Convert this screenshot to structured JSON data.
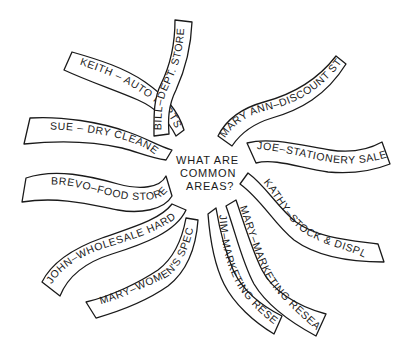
{
  "diagram": {
    "type": "brainstorm-spoke",
    "center": {
      "lines": [
        "WHAT ARE",
        "COMMON",
        "AREAS?"
      ]
    },
    "colors": {
      "ink": "#1a1a1a",
      "background": "#ffffff"
    },
    "ribbons": [
      {
        "id": "keith",
        "label": "KEITH – AUTO PARTS"
      },
      {
        "id": "bill",
        "label": "BILL–DEPT. STORE MGT."
      },
      {
        "id": "maryann",
        "label": "MARY ANN–DISCOUNT STORE"
      },
      {
        "id": "sue",
        "label": "SUE – DRY CLEANERS"
      },
      {
        "id": "joe",
        "label": "JOE–STATIONERY SALES"
      },
      {
        "id": "brevo",
        "label": "BREVO–FOOD STORE"
      },
      {
        "id": "kathy",
        "label": "KATHY–STOCK & DISPLAY"
      },
      {
        "id": "john",
        "label": "JOHN–WHOLESALE HARDWARE"
      },
      {
        "id": "mary-mr",
        "label": "MARY–MARKETING RESEARCH"
      },
      {
        "id": "jim",
        "label": "JIM–MARKETING RESEARCH"
      },
      {
        "id": "mary-ws",
        "label": "MARY–WOMEN'S SPECIALTY"
      }
    ]
  }
}
